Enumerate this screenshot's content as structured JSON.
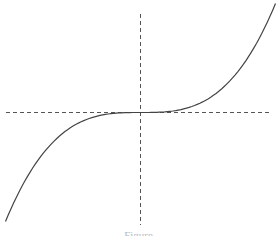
{
  "chart_data": {
    "type": "line",
    "title": "",
    "xlabel": "",
    "ylabel": "",
    "function": "y = x^3",
    "x": [
      -1.0,
      -0.8,
      -0.6,
      -0.4,
      -0.2,
      0.0,
      0.2,
      0.4,
      0.6,
      0.8,
      1.0
    ],
    "series": [
      {
        "name": "y = x^3",
        "values": [
          -1.0,
          -0.512,
          -0.216,
          -0.064,
          -0.008,
          0.0,
          0.008,
          0.064,
          0.216,
          0.512,
          1.0
        ]
      }
    ],
    "axes": {
      "style": "dashed",
      "x_axis_at": 0,
      "y_axis_at": 0
    },
    "grid": false,
    "legend": null,
    "colors": {
      "curve": "#444444",
      "axes": "#555555"
    }
  },
  "caption": "Figure"
}
